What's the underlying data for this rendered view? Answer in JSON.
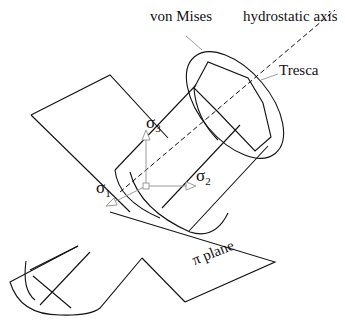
{
  "diagram": {
    "labels": {
      "von_mises": "von Mises",
      "hydrostatic_axis": "hydrostatic axis",
      "tresca": "Tresca",
      "pi_plane": "π plane",
      "sigma1": "σ",
      "sigma1_sub": "1",
      "sigma2": "σ",
      "sigma2_sub": "2",
      "sigma3": "σ",
      "sigma3_sub": "3"
    },
    "colors": {
      "line": "#111111",
      "axis_arrow": "#9a9a9a",
      "background": "#ffffff"
    }
  }
}
